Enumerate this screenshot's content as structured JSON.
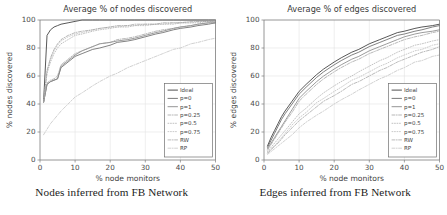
{
  "figure": {
    "panels": [
      {
        "id": "nodes",
        "title": "Average % of nodes discovered",
        "caption": "Nodes inferred from FB Network",
        "xlabel": "% node monitors",
        "ylabel": "% nodes discovered"
      },
      {
        "id": "edges",
        "title": "Average % of edges discovered",
        "caption": "Edges inferred from FB Network",
        "xlabel": "% node monitors",
        "ylabel": "% edges discovered"
      }
    ]
  },
  "legend": {
    "entries": [
      {
        "label": "Ideal",
        "style": "solid",
        "color": "#3a3a3a"
      },
      {
        "label": "p=0",
        "style": "solid",
        "color": "#6b6b6b"
      },
      {
        "label": "p=1",
        "style": "solid",
        "color": "#8a8a8a"
      },
      {
        "label": "p=0.25",
        "style": "dashdot",
        "color": "#9a9a9a"
      },
      {
        "label": "p=0.5",
        "style": "dotted",
        "color": "#a8a8a8"
      },
      {
        "label": "p=0.75",
        "style": "dotted",
        "color": "#b4b4b4"
      },
      {
        "label": "RW",
        "style": "dashdot",
        "color": "#9e9e9e"
      },
      {
        "label": "RP",
        "style": "dashdot",
        "color": "#bdbdbd"
      }
    ]
  },
  "chart_data": [
    {
      "type": "line",
      "title": "Average % of nodes discovered",
      "xlabel": "% node monitors",
      "ylabel": "% nodes discovered",
      "xlim": [
        0,
        50
      ],
      "ylim": [
        0,
        100
      ],
      "xticks": [
        0,
        10,
        20,
        30,
        40,
        50
      ],
      "yticks": [
        0,
        20,
        40,
        60,
        80,
        100
      ],
      "grid": true,
      "legend_position": "lower-right",
      "x": [
        1,
        2,
        3,
        4,
        5,
        6,
        8,
        10,
        12,
        15,
        17,
        20,
        22,
        25,
        27,
        30,
        33,
        35,
        38,
        40,
        43,
        45,
        48,
        50
      ],
      "series": [
        {
          "name": "Ideal",
          "values": [
            41,
            89,
            93,
            95,
            96,
            97,
            98,
            99,
            100,
            100,
            100,
            100,
            100,
            100,
            100,
            100,
            100,
            100,
            100,
            100,
            100,
            100,
            100,
            100
          ]
        },
        {
          "name": "p=0",
          "values": [
            41,
            54,
            56,
            57,
            58,
            66,
            70,
            74,
            76,
            79,
            80,
            82,
            84,
            85,
            86,
            88,
            90,
            91,
            93,
            94,
            95,
            96,
            97,
            98
          ]
        },
        {
          "name": "p=1",
          "values": [
            41,
            54,
            56,
            57,
            58,
            67,
            71,
            75,
            78,
            81,
            83,
            84,
            85,
            86,
            87,
            89,
            91,
            92,
            94,
            95,
            96,
            97,
            98,
            98
          ]
        },
        {
          "name": "p=0.25",
          "values": [
            41,
            55,
            57,
            58,
            60,
            68,
            72,
            76,
            78,
            81,
            83,
            84,
            86,
            87,
            88,
            90,
            92,
            93,
            94,
            95,
            96,
            97,
            98,
            98
          ]
        },
        {
          "name": "p=0.5",
          "values": [
            41,
            62,
            70,
            76,
            80,
            83,
            86,
            89,
            90,
            92,
            93,
            94,
            95,
            95,
            96,
            96,
            97,
            97,
            97,
            98,
            98,
            98,
            99,
            99
          ]
        },
        {
          "name": "p=0.75",
          "values": [
            41,
            63,
            72,
            78,
            82,
            85,
            88,
            90,
            91,
            93,
            94,
            95,
            95,
            96,
            96,
            97,
            97,
            97,
            98,
            98,
            98,
            99,
            99,
            99
          ]
        },
        {
          "name": "RW",
          "values": [
            41,
            64,
            73,
            79,
            83,
            86,
            89,
            91,
            92,
            93,
            94,
            95,
            96,
            96,
            97,
            97,
            97,
            98,
            98,
            98,
            99,
            99,
            99,
            99
          ]
        },
        {
          "name": "RP",
          "values": [
            18,
            22,
            26,
            29,
            32,
            35,
            40,
            45,
            48,
            53,
            56,
            60,
            62,
            66,
            68,
            71,
            74,
            76,
            79,
            80,
            83,
            84,
            86,
            87
          ]
        }
      ]
    },
    {
      "type": "line",
      "title": "Average % of edges discovered",
      "xlabel": "% node monitors",
      "ylabel": "% edges discovered",
      "xlim": [
        0,
        50
      ],
      "ylim": [
        0,
        100
      ],
      "xticks": [
        0,
        10,
        20,
        30,
        40,
        50
      ],
      "yticks": [
        0,
        20,
        40,
        60,
        80,
        100
      ],
      "grid": true,
      "legend_position": "lower-right",
      "x": [
        1,
        2,
        3,
        4,
        5,
        6,
        8,
        10,
        12,
        15,
        17,
        20,
        22,
        25,
        27,
        30,
        33,
        35,
        38,
        40,
        43,
        45,
        48,
        50
      ],
      "series": [
        {
          "name": "Ideal",
          "values": [
            10,
            16,
            21,
            26,
            31,
            35,
            42,
            49,
            54,
            61,
            65,
            70,
            73,
            77,
            79,
            83,
            86,
            88,
            91,
            92,
            94,
            95,
            96,
            97
          ]
        },
        {
          "name": "p=0",
          "values": [
            9,
            14,
            19,
            24,
            29,
            33,
            40,
            47,
            52,
            59,
            63,
            68,
            71,
            75,
            77,
            81,
            84,
            86,
            89,
            90,
            92,
            93,
            95,
            96
          ]
        },
        {
          "name": "p=1",
          "values": [
            8,
            12,
            16,
            20,
            24,
            28,
            36,
            44,
            49,
            56,
            60,
            65,
            68,
            72,
            74,
            78,
            81,
            83,
            86,
            88,
            90,
            91,
            92,
            93
          ]
        },
        {
          "name": "p=0.25",
          "values": [
            7,
            11,
            15,
            19,
            23,
            27,
            34,
            42,
            47,
            54,
            58,
            63,
            66,
            70,
            72,
            76,
            79,
            81,
            84,
            86,
            88,
            89,
            91,
            92
          ]
        },
        {
          "name": "p=0.5",
          "values": [
            6,
            9,
            12,
            15,
            18,
            21,
            27,
            33,
            37,
            44,
            48,
            53,
            56,
            60,
            63,
            67,
            71,
            73,
            77,
            79,
            82,
            83,
            85,
            86
          ]
        },
        {
          "name": "p=0.75",
          "values": [
            5,
            8,
            10,
            13,
            16,
            19,
            25,
            30,
            34,
            41,
            44,
            49,
            52,
            57,
            59,
            63,
            67,
            69,
            73,
            75,
            78,
            79,
            82,
            83
          ]
        },
        {
          "name": "RW",
          "values": [
            5,
            7,
            10,
            12,
            15,
            18,
            23,
            28,
            32,
            38,
            42,
            46,
            49,
            54,
            56,
            60,
            64,
            66,
            70,
            72,
            75,
            77,
            79,
            81
          ]
        },
        {
          "name": "RP",
          "values": [
            4,
            6,
            8,
            10,
            12,
            14,
            18,
            23,
            27,
            32,
            35,
            40,
            43,
            47,
            50,
            54,
            58,
            60,
            64,
            66,
            70,
            71,
            74,
            75
          ]
        }
      ]
    }
  ]
}
